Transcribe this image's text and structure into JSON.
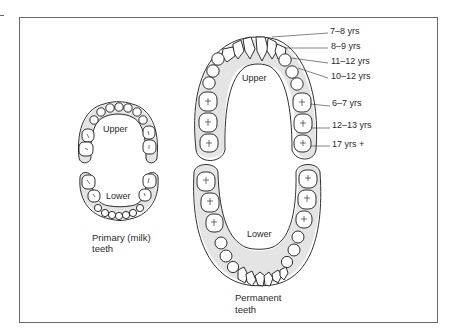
{
  "primary": {
    "upper_label": "Upper",
    "lower_label": "Lower",
    "caption_line1": "Primary (milk)",
    "caption_line2": "teeth"
  },
  "permanent": {
    "upper_label": "Upper",
    "lower_label": "Lower",
    "caption_line1": "Permanent",
    "caption_line2": "teeth",
    "eruption_ages": [
      {
        "tooth": "central incisor",
        "label": "7–8 yrs"
      },
      {
        "tooth": "lateral incisor",
        "label": "8–9 yrs"
      },
      {
        "tooth": "canine",
        "label": "11–12 yrs"
      },
      {
        "tooth": "premolars",
        "label": "10–12 yrs"
      },
      {
        "tooth": "first molar",
        "label": "6–7 yrs"
      },
      {
        "tooth": "second molar",
        "label": "12–13 yrs"
      },
      {
        "tooth": "third molar",
        "label": "17 yrs +"
      }
    ]
  },
  "colors": {
    "gum_shade": "#e4e4e4",
    "outline": "#1a1a1a",
    "frame": "#6a6a6a"
  }
}
